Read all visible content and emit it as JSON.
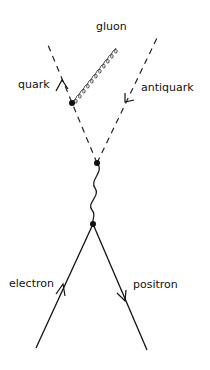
{
  "diagram": {
    "type": "feynman-diagram",
    "title": "",
    "colors": {
      "ink": "#111111",
      "background": "#ffffff"
    },
    "labels": {
      "gluon": "gluon",
      "quark": "quark",
      "antiquark": "antiquark",
      "electron": "electron",
      "positron": "positron"
    },
    "vertices": [
      {
        "id": "gluon-emission",
        "x": 72,
        "y": 103
      },
      {
        "id": "quark-annihilation-vertex",
        "x": 97,
        "y": 163
      },
      {
        "id": "lepton-annihilation-vertex",
        "x": 93,
        "y": 224
      }
    ],
    "lines": [
      {
        "id": "quark-line",
        "style": "dashed",
        "from": [
          97,
          163
        ],
        "to": [
          48,
          45
        ],
        "arrow": "outgoing"
      },
      {
        "id": "antiquark-line",
        "style": "dashed",
        "from": [
          97,
          163
        ],
        "to": [
          157,
          38
        ],
        "arrow": "incoming"
      },
      {
        "id": "gluon-line",
        "style": "coiled",
        "from": [
          72,
          103
        ],
        "to": [
          108,
          42
        ]
      },
      {
        "id": "photon-line",
        "style": "wavy",
        "from": [
          97,
          163
        ],
        "to": [
          93,
          224
        ]
      },
      {
        "id": "electron-line",
        "style": "solid",
        "from": [
          36,
          348
        ],
        "to": [
          93,
          224
        ],
        "arrow": "incoming"
      },
      {
        "id": "positron-line",
        "style": "solid",
        "from": [
          147,
          350
        ],
        "to": [
          93,
          224
        ],
        "arrow": "outgoing"
      }
    ]
  }
}
